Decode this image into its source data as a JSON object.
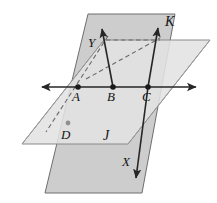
{
  "figure": {
    "type": "geometry-diagram",
    "background_color": "#ffffff"
  },
  "planes": [
    {
      "id": "plane-k",
      "label": "K",
      "label_style": "script",
      "orientation": "vertical",
      "fill_color": "#cdcdcd",
      "stroke_color": "#6e6e6e",
      "label_position": {
        "x": 170,
        "y": 24
      },
      "polygon_points": "88,14 175,14 142,193 45,193"
    },
    {
      "id": "plane-j",
      "label": "J",
      "label_style": "script",
      "orientation": "horizontal",
      "fill_color": "#e2e2e2",
      "stroke_color": "#8a8a8a",
      "label_position": {
        "x": 107,
        "y": 139
      },
      "polygon_points": "104,40 210,40 128,144 22,144"
    }
  ],
  "points": [
    {
      "id": "point-a",
      "label": "A",
      "x": 78,
      "y": 87,
      "label_x": 74,
      "label_y": 100,
      "style": "solid"
    },
    {
      "id": "point-b",
      "label": "B",
      "x": 113,
      "y": 87,
      "label_x": 109,
      "label_y": 100,
      "style": "solid"
    },
    {
      "id": "point-c",
      "label": "C",
      "x": 148,
      "y": 87,
      "label_x": 144,
      "label_y": 100,
      "style": "solid"
    },
    {
      "id": "point-d",
      "label": "D",
      "x": 68,
      "y": 123,
      "label_x": 62,
      "label_y": 138,
      "style": "light"
    }
  ],
  "rays": [
    {
      "id": "ray-horizontal-intersection",
      "label": "",
      "from": {
        "x": 42,
        "y": 87
      },
      "to": {
        "x": 196,
        "y": 87
      },
      "arrows": "both",
      "style": "solid"
    },
    {
      "id": "ray-y",
      "label": "Y",
      "from": {
        "x": 113,
        "y": 87
      },
      "to": {
        "x": 102,
        "y": 29
      },
      "arrows": "end",
      "style": "solid",
      "label_x": 90,
      "label_y": 45
    },
    {
      "id": "ray-c-up",
      "label": "",
      "from": {
        "x": 148,
        "y": 87
      },
      "to": {
        "x": 158,
        "y": 28
      },
      "arrows": "end",
      "style": "solid"
    },
    {
      "id": "ray-x",
      "label": "X",
      "from": {
        "x": 148,
        "y": 87
      },
      "to": {
        "x": 136,
        "y": 178
      },
      "arrows": "end",
      "style": "solid",
      "label_x": 124,
      "label_y": 164
    }
  ],
  "dashed_lines": [
    {
      "id": "dashed-top-horizontal",
      "from": {
        "x": 106,
        "y": 40
      },
      "to": {
        "x": 160,
        "y": 40
      }
    },
    {
      "id": "dashed-diagonal-ad",
      "from": {
        "x": 108,
        "y": 36
      },
      "to": {
        "x": 46,
        "y": 132
      }
    },
    {
      "id": "dashed-diagonal-bc",
      "from": {
        "x": 86,
        "y": 79
      },
      "to": {
        "x": 160,
        "y": 38
      }
    }
  ],
  "guide_lines": [
    {
      "id": "guide-j-front-left",
      "from": {
        "x": 22,
        "y": 144
      },
      "to": {
        "x": 104,
        "y": 40
      }
    },
    {
      "id": "guide-j-front-right",
      "from": {
        "x": 128,
        "y": 144
      },
      "to": {
        "x": 210,
        "y": 40
      }
    }
  ],
  "labels": {
    "plane_k": "K",
    "plane_j": "J",
    "point_a": "A",
    "point_b": "B",
    "point_c": "C",
    "point_d": "D",
    "ray_x": "X",
    "ray_y": "Y"
  },
  "colors": {
    "plane_vertical": "#cdcdcd",
    "plane_horizontal": "#e2e2e2",
    "line": "#262626",
    "dashed": "#6a6a6a",
    "label": "#141414"
  }
}
